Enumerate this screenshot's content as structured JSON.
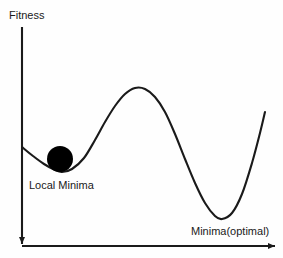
{
  "figure": {
    "title_text": "",
    "background_color": "#fefefe",
    "stroke_color": "#1a1a1a",
    "ball_color": "#000000"
  },
  "axes": {
    "y_axis": {
      "label": "Fitness",
      "icon": "vertical-axis-line",
      "arrow": "arrow-down",
      "x": 22,
      "top_y": 27,
      "bottom_y": 246
    },
    "x_axis": {
      "label": "Minima(optimal)",
      "icon": "horizontal-axis-line",
      "arrow": "arrow-right",
      "y": 246,
      "left_x": 22,
      "right_x": 277
    }
  },
  "annotations": {
    "local_minima": {
      "label": "Local Minima",
      "x": 29,
      "y": 180
    },
    "global_minima": {
      "label": "Minima(optimal)",
      "x": 191,
      "y": 226
    },
    "ball": {
      "name": "ball-marker",
      "cx": 60,
      "cy": 159,
      "r": 13
    }
  },
  "chart_data": {
    "type": "line",
    "title": "",
    "xlabel": "Minima(optimal)",
    "ylabel": "Fitness",
    "grid": false,
    "legend": null,
    "xlim": [
      22,
      277
    ],
    "ylim": [
      246,
      27
    ],
    "note": "Y axis is inverted in pixel space: lower pixel y = higher fitness. Curve traces a fitness landscape with one local minimum (where the ball rests) and one deeper global minimum.",
    "series": [
      {
        "name": "fitness-landscape",
        "points": [
          [
            22,
            147
          ],
          [
            33,
            156
          ],
          [
            44,
            164
          ],
          [
            55,
            170
          ],
          [
            62,
            172
          ],
          [
            72,
            169
          ],
          [
            84,
            158
          ],
          [
            95,
            140
          ],
          [
            105,
            122
          ],
          [
            115,
            106
          ],
          [
            125,
            94
          ],
          [
            135,
            88
          ],
          [
            145,
            89
          ],
          [
            155,
            97
          ],
          [
            165,
            112
          ],
          [
            175,
            134
          ],
          [
            185,
            159
          ],
          [
            195,
            183
          ],
          [
            205,
            203
          ],
          [
            215,
            216
          ],
          [
            222,
            219
          ],
          [
            232,
            213
          ],
          [
            242,
            194
          ],
          [
            252,
            163
          ],
          [
            260,
            133
          ],
          [
            265,
            112
          ]
        ]
      }
    ],
    "markers": [
      {
        "name": "ball",
        "x": 60,
        "y": 159,
        "label": "Local Minima",
        "shape": "filled-circle"
      }
    ]
  }
}
